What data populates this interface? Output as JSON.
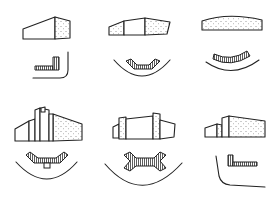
{
  "diagram": {
    "type": "building-form-and-plan-variants",
    "layout": {
      "rows": 2,
      "columns": 3
    },
    "colors": {
      "line": "#222222",
      "background": "#ffffff",
      "hatch": "#222222"
    },
    "panels": [
      {
        "id": 1,
        "row": 1,
        "col": 1,
        "massing": "single wedge block",
        "plan": "L-shaped wing",
        "ground_line": "corner curve"
      },
      {
        "id": 2,
        "row": 1,
        "col": 2,
        "massing": "three-part block with center section",
        "plan": "shallow chevron",
        "ground_line": "concave arc"
      },
      {
        "id": 3,
        "row": 1,
        "col": 3,
        "massing": "single curved-roof block",
        "plan": "curved bar",
        "ground_line": "concave arc"
      },
      {
        "id": 4,
        "row": 2,
        "col": 1,
        "massing": "stepped tower block with tall core",
        "plan": "V-shape with central entry",
        "ground_line": "concave arc"
      },
      {
        "id": 5,
        "row": 2,
        "col": 2,
        "massing": "twin-tower block with end wings",
        "plan": "double-Y bar",
        "ground_line": "concave arc"
      },
      {
        "id": 6,
        "row": 2,
        "col": 3,
        "massing": "low block with taller block",
        "plan": "L-shaped bar",
        "ground_line": "corner curve"
      }
    ]
  }
}
